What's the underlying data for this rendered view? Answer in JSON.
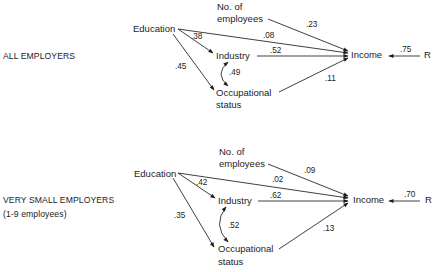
{
  "panels": [
    {
      "title": "ALL EMPLOYERS",
      "subtitle": "",
      "nodes": {
        "education": "Education",
        "employees_line1": "No. of",
        "employees_line2": "employees",
        "industry": "Industry",
        "occupational_line1": "Occupational",
        "occupational_line2": "status",
        "income": "Income",
        "residual": "R"
      },
      "coefficients": {
        "education_industry": ".38",
        "education_income": ".08",
        "employees_income": ".23",
        "industry_income": ".52",
        "industry_occupational_correlation": ".49",
        "education_occupational": ".45",
        "occupational_income": ".11",
        "residual_income": ".75"
      }
    },
    {
      "title": "VERY SMALL EMPLOYERS",
      "subtitle": "(1-9 employees)",
      "nodes": {
        "education": "Education",
        "employees_line1": "No. of",
        "employees_line2": "employees",
        "industry": "Industry",
        "occupational_line1": "Occupational",
        "occupational_line2": "status",
        "income": "Income",
        "residual": "R"
      },
      "coefficients": {
        "education_industry": ".42",
        "education_income": ".02",
        "employees_income": ".09",
        "industry_income": ".62",
        "industry_occupational_correlation": ".52",
        "education_occupational": ".35",
        "occupational_income": ".13",
        "residual_income": ".70"
      }
    }
  ]
}
